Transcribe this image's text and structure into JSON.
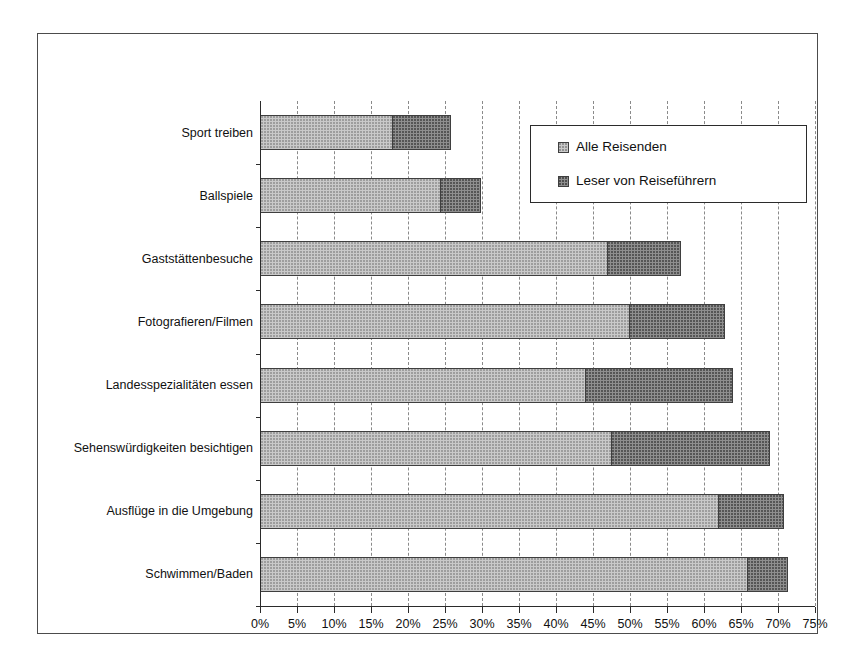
{
  "chart_data": {
    "type": "bar",
    "orientation": "horizontal",
    "stacked": true,
    "title": "",
    "subtitle": "",
    "xlabel": "",
    "ylabel": "",
    "xlim": [
      0,
      75
    ],
    "xtick_step": 5,
    "grid": true,
    "grid_axis": "x",
    "grid_style": "dashed",
    "legend_position": "upper right (inside plot)",
    "categories": [
      "Sport treiben",
      "Ballspiele",
      "Gaststättenbesuche",
      "Fotografieren/Filmen",
      "Landesspezialitäten essen",
      "Sehenswürdigkeiten besichtigen",
      "Ausflüge in die Umgebung",
      "Schwimmen/Baden"
    ],
    "xticklabels": [
      "0%",
      "5%",
      "10%",
      "15%",
      "20%",
      "25%",
      "30%",
      "35%",
      "40%",
      "45%",
      "50%",
      "55%",
      "60%",
      "65%",
      "70%",
      "75%"
    ],
    "xtickvalues": [
      0,
      5,
      10,
      15,
      20,
      25,
      30,
      35,
      40,
      45,
      50,
      55,
      60,
      65,
      70,
      75
    ],
    "series": [
      {
        "name": "Alle Reisenden",
        "color": "#c9c9c9",
        "values": [
          18,
          24.5,
          47,
          50,
          44,
          47.5,
          62,
          66
        ]
      },
      {
        "name": "Leser von Reiseführern",
        "color": "#8e8e8e",
        "values": [
          26,
          30,
          57,
          63,
          64,
          69,
          71,
          71.5
        ]
      }
    ]
  },
  "legend": {
    "entries": [
      {
        "label": "Alle Reisenden",
        "swatch": "light"
      },
      {
        "label": "Leser von Reiseführern",
        "swatch": "dark"
      }
    ]
  }
}
